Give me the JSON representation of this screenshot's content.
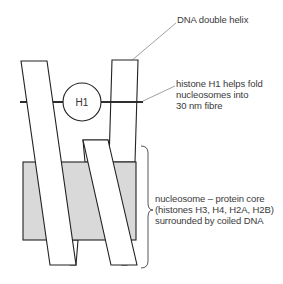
{
  "diagram": {
    "type": "labelled biological schematic",
    "elements": {
      "dna_strands": 2,
      "histone_h1_circle_label": "H1",
      "nucleosome_core_fill": "#d9d9d9"
    },
    "labels": {
      "dna": "DNA double helix",
      "h1_line1": "histone H1 helps fold",
      "h1_line2": "nucleosomes into",
      "h1_line3": "30 nm fibre",
      "nucleosome_line1": "nucleosome – protein core",
      "nucleosome_line2": "(histones H3, H4, H2A, H2B)",
      "nucleosome_line3": "surrounded by coiled DNA"
    }
  }
}
